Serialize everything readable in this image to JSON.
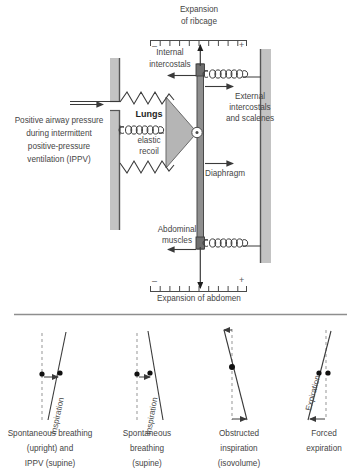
{
  "figure": {
    "title_top": "Expansion of ribcage",
    "title_bottom": "Expansion of abdomen"
  },
  "top_scale": {
    "label_line1": "Expansion",
    "label_line2": "of ribcage",
    "minus": "–",
    "plus": "+",
    "ticks": 11
  },
  "bottom_scale": {
    "label": "Expansion of abdomen",
    "minus": "–",
    "plus": "+",
    "ticks": 11
  },
  "labels": {
    "internal_intercostals_l1": "Internal",
    "internal_intercostals_l2": "intercostals",
    "external_l1": "External",
    "external_l2": "intercostals",
    "external_l3": "and scalenes",
    "lungs": "Lungs",
    "lungs_sub1": "elastic",
    "lungs_sub2": "recoil",
    "diaphragm": "Diaphragm",
    "abdominal_l1": "Abdominal",
    "abdominal_l2": "muscles",
    "ippv_l1": "Positive airway pressure",
    "ippv_l2": "during intermittent",
    "ippv_l3": "positive-pressure",
    "ippv_l4": "ventilation (IPPV)"
  },
  "icons": {
    "spring": "spring-coil-icon",
    "zigzag": "zigzag-spring-icon",
    "pivot": "pivot-joint-icon",
    "arrow": "arrow-icon"
  },
  "colors": {
    "wall": "#c3c3c3",
    "wall_edge": "#7c7c7c",
    "bar": "#8f8f8f",
    "bar_edge": "#4a4a4a",
    "lung_fill": "#b5b5b5",
    "ink": "#3a3a3a",
    "dash": "#b0b0b0",
    "divider": "#8e8e8e"
  },
  "panels": [
    {
      "id": "panel-1",
      "rotated_label": "Inspiration",
      "caption_lines": [
        "Spontaneous breathing",
        "(upright) and",
        "IPPV (supine)"
      ]
    },
    {
      "id": "panel-2",
      "rotated_label": "Inspiration",
      "caption_lines": [
        "Spontaneous",
        "breathing",
        "(supine)"
      ]
    },
    {
      "id": "panel-3",
      "rotated_label": "",
      "caption_lines": [
        "Obstructed",
        "inspiration",
        "(isovolume)"
      ]
    },
    {
      "id": "panel-4",
      "rotated_label": "Expiration",
      "caption_lines": [
        "Forced",
        "expiration"
      ]
    }
  ]
}
